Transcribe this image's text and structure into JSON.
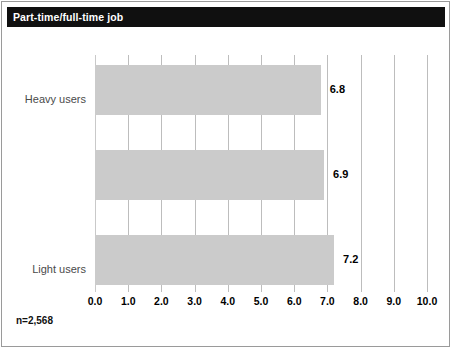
{
  "title": "Part-time/full-time job",
  "note": "n=2,568",
  "chart_data": {
    "type": "bar",
    "orientation": "horizontal",
    "title": "Part-time/full-time job",
    "categories": [
      "Heavy users",
      "Light users",
      "Nonusers"
    ],
    "values": [
      6.8,
      6.9,
      7.2
    ],
    "value_labels": [
      "6.8",
      "6.9",
      "7.2"
    ],
    "xlabel": "",
    "ylabel": "",
    "xlim": [
      0.0,
      10.0
    ],
    "xticks": [
      0.0,
      1.0,
      2.0,
      3.0,
      4.0,
      5.0,
      6.0,
      7.0,
      8.0,
      9.0,
      10.0
    ],
    "xtick_labels": [
      "0.0",
      "1.0",
      "2.0",
      "3.0",
      "4.0",
      "5.0",
      "6.0",
      "7.0",
      "8.0",
      "9.0",
      "10.0"
    ],
    "grid": true,
    "grid_axis": "x",
    "legend": false,
    "annotation": "n=2,568",
    "bar_color": "#cbcbcb",
    "grid_color": "#bdbdbd",
    "title_bar_color": "#101010",
    "title_text_color": "#ffffff"
  }
}
